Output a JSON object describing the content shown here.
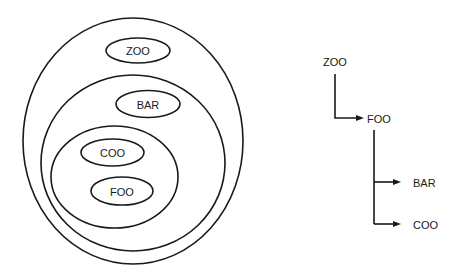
{
  "diagram": {
    "type": "nested-scope-and-tree",
    "stroke_color": "#1a1a1a",
    "background": "#ffffff",
    "scopes": {
      "outer": {
        "name": "outer-scope"
      },
      "middle": {
        "name": "middle-scope"
      },
      "inner": {
        "name": "inner-scope"
      },
      "nodes": [
        {
          "id": "zoo",
          "label": "ZOO",
          "scope": "outer"
        },
        {
          "id": "bar",
          "label": "BAR",
          "scope": "middle"
        },
        {
          "id": "coo",
          "label": "COO",
          "scope": "inner"
        },
        {
          "id": "foo",
          "label": "FOO",
          "scope": "inner"
        }
      ]
    },
    "tree": {
      "root": {
        "label": "ZOO"
      },
      "level1": {
        "label": "FOO"
      },
      "children": [
        {
          "label": "BAR"
        },
        {
          "label": "COO"
        }
      ],
      "edges": [
        {
          "from": "ZOO",
          "to": "FOO"
        },
        {
          "from": "FOO",
          "to": "BAR"
        },
        {
          "from": "FOO",
          "to": "COO"
        }
      ]
    }
  }
}
